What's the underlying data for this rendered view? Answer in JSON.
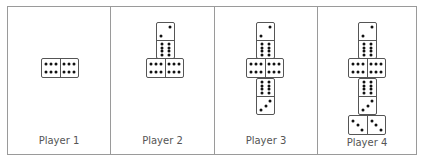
{
  "colors": {
    "border": "#9a9a9a",
    "tile_border": "#555555",
    "pip": "#111111",
    "label": "#555555",
    "background": "#ffffff"
  },
  "panels": [
    {
      "label": "Player 1",
      "tiles": [
        {
          "orientation": "horizontal",
          "values": [
            6,
            6
          ]
        }
      ]
    },
    {
      "label": "Player 2",
      "tiles": [
        {
          "orientation": "vertical",
          "values": [
            2,
            8
          ]
        },
        {
          "orientation": "horizontal",
          "values": [
            6,
            6
          ]
        }
      ]
    },
    {
      "label": "Player 3",
      "tiles": [
        {
          "orientation": "vertical",
          "values": [
            2,
            8
          ]
        },
        {
          "orientation": "horizontal",
          "values": [
            6,
            6
          ]
        },
        {
          "orientation": "vertical",
          "values": [
            8,
            3
          ]
        }
      ]
    },
    {
      "label": "Player 4",
      "tiles": [
        {
          "orientation": "vertical",
          "values": [
            2,
            8
          ]
        },
        {
          "orientation": "horizontal",
          "values": [
            6,
            6
          ]
        },
        {
          "orientation": "vertical",
          "values": [
            8,
            3
          ]
        },
        {
          "orientation": "horizontal",
          "values": [
            3,
            3
          ]
        }
      ]
    }
  ]
}
